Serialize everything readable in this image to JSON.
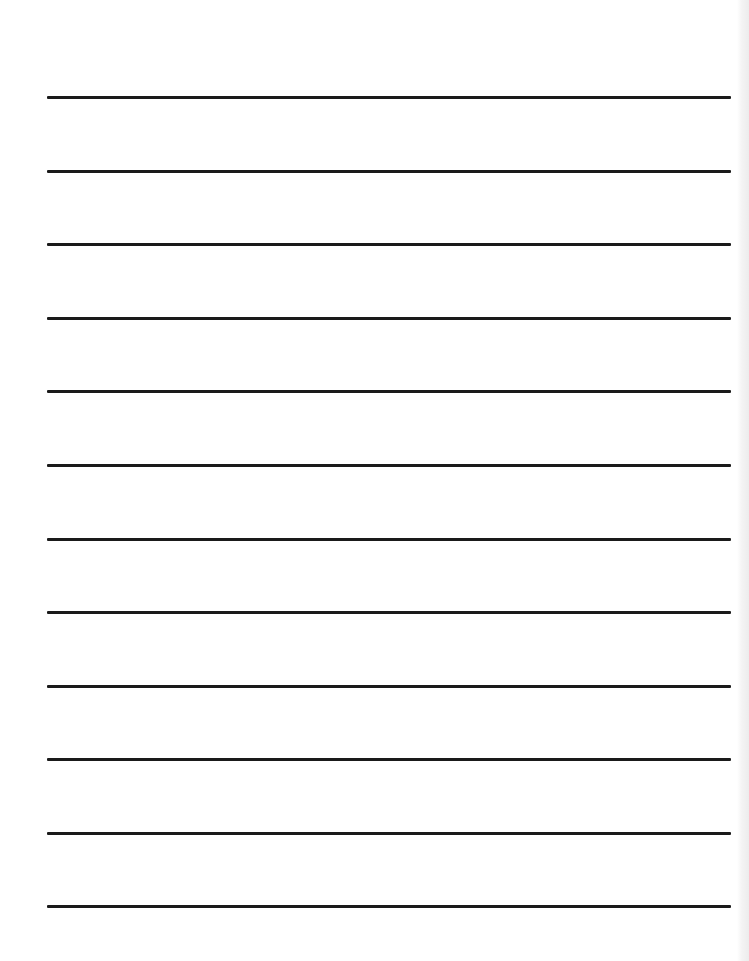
{
  "page": {
    "type": "lined-writing-paper",
    "background_color": "#ffffff",
    "rule_color": "#1a1a1a",
    "rule_count": 12,
    "rule_left_px": 47,
    "rule_right_px": 731,
    "rule_thickness_px": 3,
    "rule_positions_px": [
      97,
      171,
      244,
      318,
      391,
      465,
      539,
      612,
      686,
      759,
      833,
      906
    ]
  },
  "bleed_through": {
    "title": "",
    "lines": []
  }
}
